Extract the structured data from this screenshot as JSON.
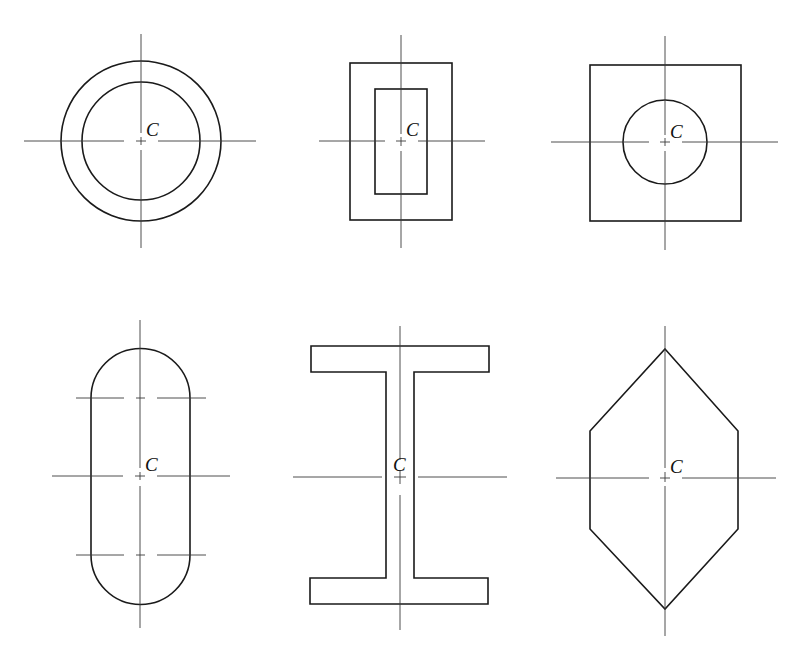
{
  "figure": {
    "centroid_label": "C",
    "colors": {
      "outline": "#1a1a1a",
      "axis": "#3a3a3a",
      "background": "#ffffff"
    }
  },
  "shapes": [
    {
      "id": "annulus",
      "name": "Hollow circle (ring)",
      "label": "C"
    },
    {
      "id": "rect-frame",
      "name": "Hollow rectangle",
      "label": "C"
    },
    {
      "id": "square-with-circle",
      "name": "Square with circular hole",
      "label": "C"
    },
    {
      "id": "stadium",
      "name": "Rounded slot (stadium)",
      "label": "C"
    },
    {
      "id": "i-beam",
      "name": "I-beam section",
      "label": "C"
    },
    {
      "id": "hexagon",
      "name": "Elongated hexagon",
      "label": "C"
    }
  ]
}
